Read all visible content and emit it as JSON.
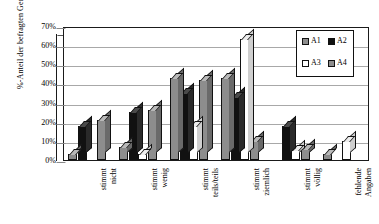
{
  "chart_data": {
    "type": "bar",
    "title": "",
    "xlabel": "",
    "ylabel": "%-Anteil der befragten Gemeinden",
    "ylim": [
      0,
      70
    ],
    "ytick_labels": [
      "70%",
      "60%",
      "50%",
      "40%",
      "30%",
      "20%",
      "10%",
      "0%"
    ],
    "ytick_values": [
      70,
      60,
      50,
      40,
      30,
      20,
      10,
      0
    ],
    "grid": "horizontal",
    "legend_position": "inside-top-right",
    "legend_entries": [
      "A1",
      "A2",
      "A3",
      "A4"
    ],
    "categories": [
      "stimmt nicht",
      "stimmt wenig",
      "stimmt teils/teils",
      "stimmt ziemlich",
      "stimmt völlig",
      "fehlende Angaben"
    ],
    "category_lines": [
      [
        "stimmt",
        "nicht"
      ],
      [
        "stimmt",
        "wenig"
      ],
      [
        "stimmt",
        "teils/teils"
      ],
      [
        "stimmt",
        "ziemlich"
      ],
      [
        "stimmt",
        "völlig"
      ],
      [
        "fehlende",
        "Angaben"
      ]
    ],
    "series": [
      {
        "name": "A1",
        "color": "#8d8d8d",
        "values": [
          3,
          7,
          43,
          43,
          0,
          3
        ]
      },
      {
        "name": "A2",
        "color": "#111111",
        "values": [
          18,
          25,
          35,
          33,
          18,
          0
        ]
      },
      {
        "name": "A3",
        "color": "#ffffff",
        "values": [
          0,
          3,
          18,
          63,
          5,
          10
        ]
      },
      {
        "name": "A4",
        "color": "#8d8d8d",
        "values": [
          21,
          26,
          42,
          10,
          6,
          0
        ]
      }
    ]
  }
}
